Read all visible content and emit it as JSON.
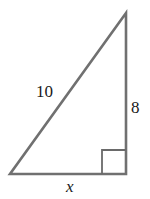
{
  "diagram": {
    "type": "right-triangle",
    "vertices": {
      "bottom_left": [
        10,
        174
      ],
      "bottom_right": [
        126,
        174
      ],
      "top": [
        126,
        13
      ]
    },
    "right_angle_marker": {
      "corner": "bottom_right",
      "size": 24
    },
    "labels": {
      "hypotenuse": "10",
      "vertical_leg": "8",
      "base": "x"
    },
    "colors": {
      "stroke": "#707070",
      "marker_stroke": "#6a6a6a",
      "text": "#1a1a1a",
      "background": "#ffffff"
    }
  }
}
